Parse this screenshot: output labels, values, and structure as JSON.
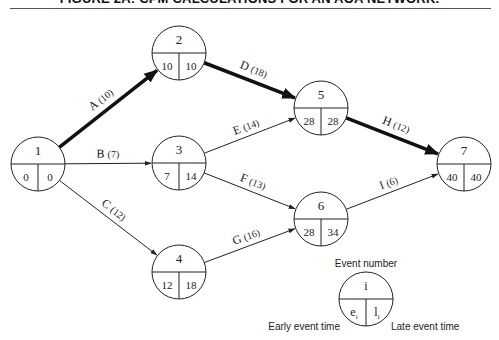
{
  "title": "FIGURE 2A: CPM CALCULATIONS FOR AN AOA NETWORK.",
  "colors": {
    "line": "#222222",
    "critical": "#111111",
    "background": "#ffffff"
  },
  "nodes": [
    {
      "id": "1",
      "cx": 38,
      "cy": 164,
      "early": "0",
      "late": "0"
    },
    {
      "id": "2",
      "cx": 179,
      "cy": 53,
      "early": "10",
      "late": "10"
    },
    {
      "id": "3",
      "cx": 179,
      "cy": 163,
      "early": "7",
      "late": "14"
    },
    {
      "id": "4",
      "cx": 179,
      "cy": 272,
      "early": "12",
      "late": "18"
    },
    {
      "id": "5",
      "cx": 321,
      "cy": 108,
      "early": "28",
      "late": "28"
    },
    {
      "id": "6",
      "cx": 321,
      "cy": 219,
      "early": "28",
      "late": "34"
    },
    {
      "id": "7",
      "cx": 464,
      "cy": 164,
      "early": "40",
      "late": "40"
    }
  ],
  "activities": [
    {
      "name": "A",
      "duration": "(10)",
      "from": "1",
      "to": "2",
      "critical": true
    },
    {
      "name": "B",
      "duration": "(7)",
      "from": "1",
      "to": "3",
      "critical": false
    },
    {
      "name": "C",
      "duration": "(12)",
      "from": "1",
      "to": "4",
      "critical": false
    },
    {
      "name": "D",
      "duration": "(18)",
      "from": "2",
      "to": "5",
      "critical": true
    },
    {
      "name": "E",
      "duration": "(14)",
      "from": "3",
      "to": "5",
      "critical": false
    },
    {
      "name": "F",
      "duration": "(13)",
      "from": "3",
      "to": "6",
      "critical": false
    },
    {
      "name": "G",
      "duration": "(16)",
      "from": "4",
      "to": "6",
      "critical": false
    },
    {
      "name": "H",
      "duration": "(12)",
      "from": "5",
      "to": "7",
      "critical": true
    },
    {
      "name": "I",
      "duration": "(6)",
      "from": "6",
      "to": "7",
      "critical": false
    }
  ],
  "legend": {
    "cx": 366,
    "cy": 299,
    "symbol_top": "i",
    "symbol_left": "e",
    "symbol_left_sub": "i",
    "symbol_right": "l",
    "symbol_right_sub": "i",
    "event_number_label": "Event number",
    "early_label": "Early event time",
    "late_label": "Late event time"
  }
}
